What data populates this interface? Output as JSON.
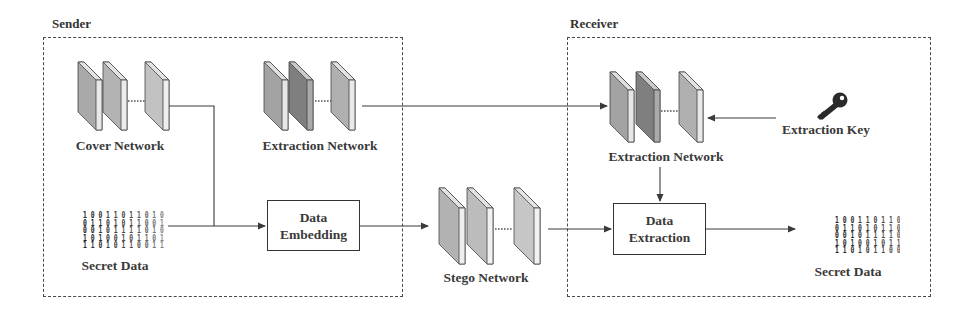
{
  "sender": {
    "title": "Sender",
    "cover_network_label": "Cover Network",
    "extraction_network_label": "Extraction Network",
    "secret_data_label": "Secret Data",
    "data_embedding": {
      "line1": "Data",
      "line2": "Embedding"
    }
  },
  "middle": {
    "stego_network_label": "Stego Network"
  },
  "receiver": {
    "title": "Receiver",
    "extraction_network_label": "Extraction Network",
    "extraction_key_label": "Extraction Key",
    "data_extraction": {
      "line1": "Data",
      "line2": "Extraction"
    },
    "secret_data_label": "Secret Data"
  },
  "colors": {
    "layer_light": "#bdbdbd",
    "layer_mid": "#a6a6a6",
    "layer_dark": "#8a8a8a",
    "layer_edge": "#e6e6e6",
    "line": "#3a3a3a"
  },
  "bits": {
    "rows": [
      "1 0 0 1 1 0 1 1 0 1 0 1",
      "0 1 1 0 1 0 1 1 0 0 1 0",
      "0 0 1 0 1 1 1 1 0 1 0 1",
      "1 0 1 0 0 1 0 1 1 0 1 0",
      "1 1 0 1 0 1 1 0 0 1 1 0",
      "1 0 0 1 0 1 0 1 1 1 0 1"
    ]
  }
}
